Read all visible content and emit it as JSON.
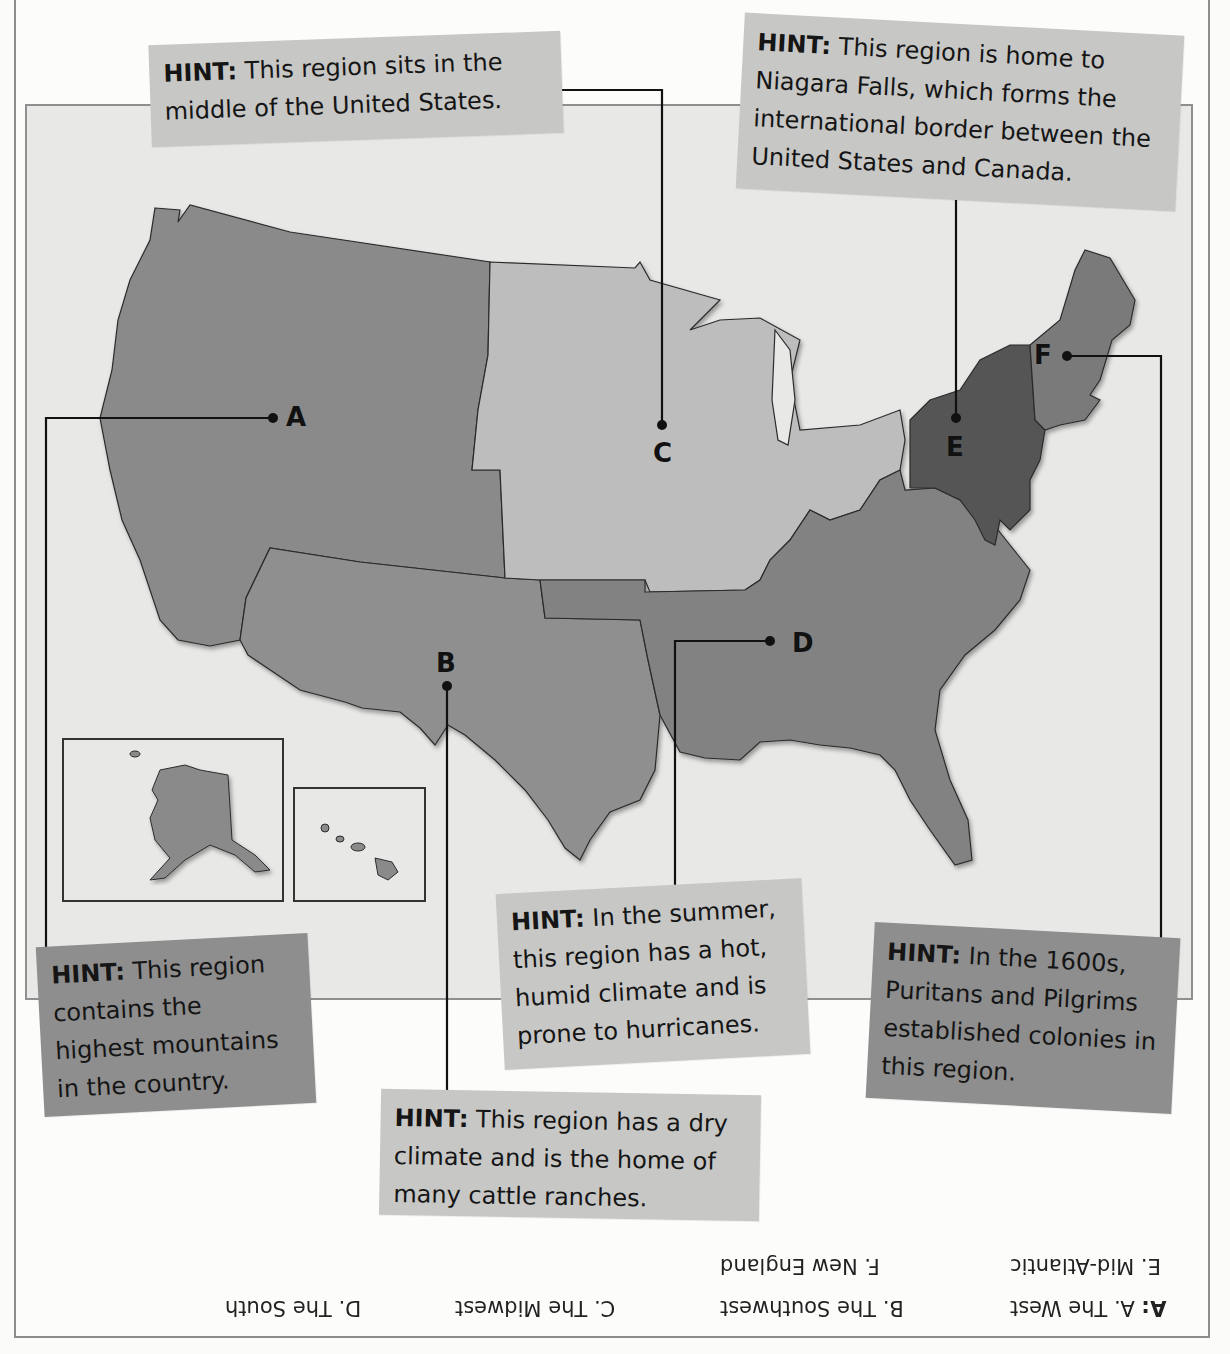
{
  "worksheet": {
    "title": "United States Regions Map",
    "regions": [
      {
        "letter": "A",
        "fill": "#8a8a8a"
      },
      {
        "letter": "B",
        "fill": "#8f8f8f"
      },
      {
        "letter": "C",
        "fill": "#bdbdbd"
      },
      {
        "letter": "D",
        "fill": "#828282"
      },
      {
        "letter": "E",
        "fill": "#555555"
      },
      {
        "letter": "F",
        "fill": "#7a7a7a"
      }
    ],
    "markers": {
      "A": "A",
      "B": "B",
      "C": "C",
      "D": "D",
      "E": "E",
      "F": "F"
    },
    "hints": {
      "midwest": {
        "label": "HINT:",
        "text": "This region sits in the middle of the United States."
      },
      "midatlantic": {
        "label": "HINT:",
        "text": "This region is home to Niagara Falls, which forms the international border between the United States and Canada."
      },
      "west": {
        "label": "HINT:",
        "text": "This region contains the highest mountains in the country."
      },
      "southwest": {
        "label": "HINT:",
        "text": "This region has a dry climate and is the home of many cattle ranches."
      },
      "south": {
        "label": "HINT:",
        "text": "In the summer, this region has a hot, humid climate and is prone to hurricanes."
      },
      "newengland": {
        "label": "HINT:",
        "text": "In the 1600s, Puritans and Pilgrims established colonies in this region."
      }
    },
    "answer_key": {
      "prefix": "A:",
      "row1": [
        "A. The West",
        "B. The Southwest",
        "C. The Midwest",
        "D. The South"
      ],
      "row2": [
        "E. Mid-Atlantic",
        "F. New England"
      ]
    },
    "colors": {
      "hint_light": "#c7c7c6",
      "hint_dark": "#8e8e8e",
      "map_background": "#e8e8e6",
      "leader_line": "#111111"
    }
  }
}
